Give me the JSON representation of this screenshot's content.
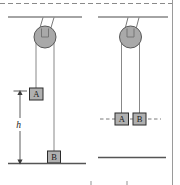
{
  "figure": {
    "type": "physics-pulley-diagram",
    "colors": {
      "line": "#4a4a4a",
      "pulley_fill": "#a9a9a9",
      "pulley_stroke": "#595959",
      "block_fill": "#b0b0b0",
      "block_stroke": "#2b2b2b",
      "ground": "#555555",
      "dashed": "#6b6b6b",
      "text": "#1a1a1a",
      "page_rule": "#8a8a8a"
    },
    "panels": [
      {
        "name": "left-panel",
        "blocks": [
          {
            "label": "A",
            "state": "raised"
          },
          {
            "label": "B",
            "state": "on-ground"
          }
        ],
        "dimension": {
          "label": "h",
          "kind": "vertical-double-arrow"
        },
        "ground": true,
        "dashed_level_line": false
      },
      {
        "name": "right-panel",
        "blocks": [
          {
            "label": "A",
            "state": "level"
          },
          {
            "label": "B",
            "state": "level"
          }
        ],
        "dimension": null,
        "ground": true,
        "dashed_level_line": true
      }
    ]
  }
}
